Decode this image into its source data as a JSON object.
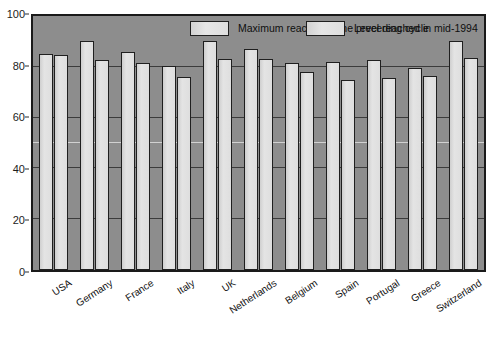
{
  "chart_data": {
    "type": "bar",
    "title": "",
    "subtitle": "",
    "xlabel": "",
    "ylabel": "",
    "ylim": [
      0,
      100
    ],
    "yticks": [
      0,
      20,
      40,
      60,
      80,
      100
    ],
    "grid": true,
    "legend_position": "top-inside",
    "categories": [
      "USA",
      "Germany",
      "France",
      "Italy",
      "UK",
      "Netherlands",
      "Belgium",
      "Spain",
      "Portugal",
      "Greece",
      "Switzerland"
    ],
    "series": [
      {
        "name": "Maximum reached in the preceding cycle",
        "values": [
          85,
          90,
          86,
          80.5,
          90,
          87,
          81.5,
          82,
          82.5,
          79.5,
          90
        ]
      },
      {
        "name": "Level reached in mid-1994",
        "values": [
          84.5,
          82.5,
          81.5,
          76,
          83,
          83,
          78,
          75,
          75.5,
          76.5,
          83.5
        ]
      }
    ]
  },
  "legend": {
    "items": [
      {
        "label": "Maximum reached in the preceding cycle"
      },
      {
        "label": "Level reached in mid-1994"
      }
    ]
  },
  "axis": {
    "y_tick_labels": [
      "100",
      "80",
      "60",
      "40",
      "20",
      "0"
    ]
  },
  "colors": {
    "plot_background": "#8d8d8d",
    "bar_fill": "#dedede",
    "bar_edge": "#1f1f1f",
    "gridline": "#3b3b3b",
    "gridline_highlight": "#e8e8e8",
    "axis_text": "#111111",
    "page_background": "#ffffff"
  }
}
